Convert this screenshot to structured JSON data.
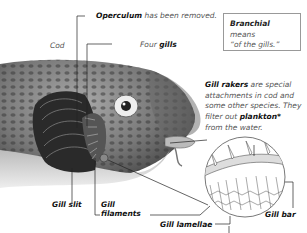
{
  "diagram": {
    "subject": "Cod",
    "labels": {
      "operculum_bold": "Operculum",
      "operculum_rest": " has been removed.",
      "four": "Four ",
      "gills": "gills",
      "gill_slit": "Gill slit",
      "gill_filaments_1": "Gill",
      "gill_filaments_2": "filaments",
      "gill_lamellae": "Gill lamellae",
      "gill_bar": "Gill bar"
    },
    "definition_box": {
      "term": "Branchial",
      "text_1": " means",
      "text_2": "“of the gills.”"
    },
    "note": {
      "term": "Gill rakers",
      "line_1_rest": " are special",
      "line_2": "attachments in cod and",
      "line_3": "some other species. They",
      "line_4_pre": "filter out ",
      "line_4_term": "plankton*",
      "line_5": "from the water."
    }
  }
}
